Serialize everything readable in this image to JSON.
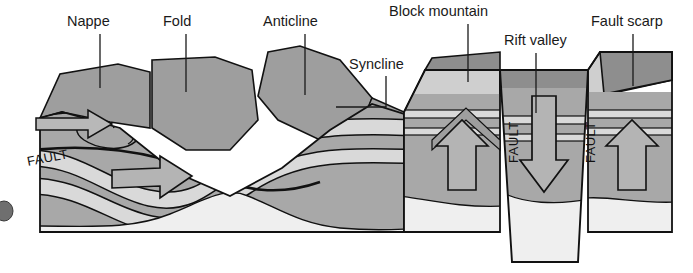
{
  "diagram": {
    "kind": "geological-block-diagram",
    "labels": [
      {
        "id": "nappe",
        "text": "Nappe",
        "x": 67,
        "y": 26,
        "leader": "M100,34 L100,88"
      },
      {
        "id": "fold",
        "text": "Fold",
        "x": 163,
        "y": 26,
        "leader": "M186,34 L186,92"
      },
      {
        "id": "anticline",
        "text": "Anticline",
        "x": 263,
        "y": 26,
        "leader": "M305,34 L305,95"
      },
      {
        "id": "syncline",
        "text": "Syncline",
        "x": 349,
        "y": 69,
        "leader": "M386,76 L386,107 L336,107"
      },
      {
        "id": "block-mountain",
        "text": "Block mountain",
        "x": 389,
        "y": 16,
        "leader": "M468,24 L468,82"
      },
      {
        "id": "rift-valley",
        "text": "Rift valley",
        "x": 504,
        "y": 45,
        "leader": "M536,53 L536,113"
      },
      {
        "id": "fault-scarp",
        "text": "Fault scarp",
        "x": 591,
        "y": 26,
        "leader": "M633,34 L633,86"
      }
    ],
    "fault_labels": [
      {
        "id": "fault-thrust",
        "text": "FAULT",
        "x": 28,
        "y": 166,
        "rotate": -11
      },
      {
        "id": "fault-left",
        "text": "FAULT",
        "x": 518,
        "y": 163,
        "rotate": -90
      },
      {
        "id": "fault-right",
        "text": "FAULT",
        "x": 595,
        "y": 163,
        "rotate": -90
      }
    ],
    "motion_arrows": [
      {
        "id": "thrust-arrow-upper",
        "direction": "right",
        "note": "nappe thrust"
      },
      {
        "id": "thrust-arrow-lower",
        "direction": "right",
        "note": "fold shortening"
      },
      {
        "id": "horst-arrow-left",
        "direction": "up",
        "note": "block mountain uplift"
      },
      {
        "id": "graben-arrow",
        "direction": "down",
        "note": "rift valley subsidence"
      },
      {
        "id": "horst-arrow-right",
        "direction": "up",
        "note": "fault scarp uplift"
      }
    ],
    "palette": {
      "stroke": "#111111",
      "top_face": "#8e8e8e",
      "front_dark": "#9a9a9a",
      "front_mid": "#a8a8a8",
      "front_light": "#c3c3c3",
      "basement": "#ececec",
      "marker_bed": "#d8d8d8",
      "arrow_fill": "#b4b4b4",
      "background": "#ffffff",
      "text": "#1a1a1a"
    },
    "artifact": {
      "id": "edge-dot",
      "note": "scan artifact dot at left margin"
    }
  }
}
